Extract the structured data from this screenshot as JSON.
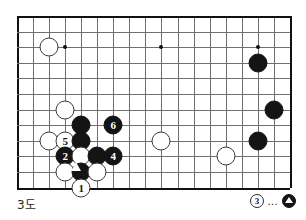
{
  "figure": {
    "label": "3도",
    "board": {
      "cols": 18,
      "rows": 12,
      "origin_x": 17,
      "origin_y": 16,
      "cell_w": 16.05,
      "cell_h": 15.6,
      "line_color": "#6d6f72",
      "edge_color": "#111111"
    },
    "star_points": [
      {
        "col": 3,
        "row": 2
      },
      {
        "col": 9,
        "row": 2
      },
      {
        "col": 15,
        "row": 2
      }
    ],
    "stones": [
      {
        "id": "w-top-left",
        "col": 2,
        "row": 2,
        "color": "white",
        "label": "",
        "mark": ""
      },
      {
        "id": "b-right-upper",
        "col": 15,
        "row": 3,
        "color": "black",
        "label": "",
        "mark": ""
      },
      {
        "id": "b-right-mid",
        "col": 16,
        "row": 6,
        "color": "black",
        "label": "",
        "mark": ""
      },
      {
        "id": "b-right-lower",
        "col": 15,
        "row": 8,
        "color": "black",
        "label": "",
        "mark": ""
      },
      {
        "id": "w-left-upper",
        "col": 3,
        "row": 6,
        "color": "white",
        "label": "",
        "mark": ""
      },
      {
        "id": "b-upper-grp",
        "col": 4,
        "row": 7,
        "color": "black",
        "label": "",
        "mark": ""
      },
      {
        "id": "move-6",
        "col": 6,
        "row": 7,
        "color": "black",
        "label": "6",
        "mark": ""
      },
      {
        "id": "w-center",
        "col": 9,
        "row": 8,
        "color": "white",
        "label": "",
        "mark": ""
      },
      {
        "id": "w-left-edge",
        "col": 2,
        "row": 8,
        "color": "white",
        "label": "",
        "mark": ""
      },
      {
        "id": "move-5",
        "col": 3,
        "row": 8,
        "color": "white",
        "label": "5",
        "mark": ""
      },
      {
        "id": "b-mid-grp",
        "col": 4,
        "row": 8,
        "color": "black",
        "label": "",
        "mark": ""
      },
      {
        "id": "move-2",
        "col": 3,
        "row": 9,
        "color": "black",
        "label": "2",
        "mark": ""
      },
      {
        "id": "w-grp-a",
        "col": 4,
        "row": 9,
        "color": "white",
        "label": "",
        "mark": ""
      },
      {
        "id": "b-grp-b",
        "col": 5,
        "row": 9,
        "color": "black",
        "label": "",
        "mark": ""
      },
      {
        "id": "move-4",
        "col": 6,
        "row": 9,
        "color": "black",
        "label": "4",
        "mark": ""
      },
      {
        "id": "w-right-low",
        "col": 13,
        "row": 9,
        "color": "white",
        "label": "",
        "mark": ""
      },
      {
        "id": "w-grp-c",
        "col": 3,
        "row": 10,
        "color": "white",
        "label": "",
        "mark": ""
      },
      {
        "id": "b-triangle",
        "col": 4,
        "row": 10,
        "color": "black",
        "label": "",
        "mark": "triangle"
      },
      {
        "id": "w-grp-d",
        "col": 5,
        "row": 10,
        "color": "white",
        "label": "",
        "mark": ""
      },
      {
        "id": "move-1",
        "col": 4,
        "row": 11,
        "color": "white",
        "label": "1",
        "mark": ""
      }
    ]
  },
  "move_note": {
    "move_number": "3",
    "separator": "…",
    "target_stone_color": "black",
    "target_stone_mark": "triangle"
  }
}
